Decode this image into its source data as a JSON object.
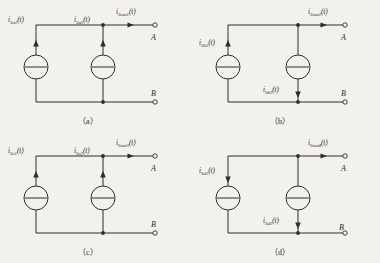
{
  "figure": {
    "type": "circuit-diagram",
    "background_color": "#f2f1ee",
    "line_color": "#2e2c2a"
  },
  "panels": [
    {
      "id": "a",
      "caption": "（a）",
      "terminal_a": "A",
      "terminal_b": "B",
      "output": {
        "label_main": "i",
        "label_sub": "Sout1",
        "label_tail": "(t)",
        "arrow_direction": "right"
      },
      "sources": [
        {
          "name": "source-left",
          "label_main": "i",
          "label_sub": "Sa1",
          "label_tail": "(t)",
          "arrow_direction": "up",
          "label_position": "top-left"
        },
        {
          "name": "source-right",
          "label_main": "i",
          "label_sub": "Sa2",
          "label_tail": "(t)",
          "arrow_direction": "up",
          "label_position": "top-left"
        }
      ]
    },
    {
      "id": "b",
      "caption": "（b）",
      "terminal_a": "A",
      "terminal_b": "B",
      "output": {
        "label_main": "i",
        "label_sub": "Sout2",
        "label_tail": "(t)",
        "arrow_direction": "right"
      },
      "sources": [
        {
          "name": "source-left",
          "label_main": "i",
          "label_sub": "Sb1",
          "label_tail": "(t)",
          "arrow_direction": "up",
          "label_position": "top-left"
        },
        {
          "name": "source-right",
          "label_main": "i",
          "label_sub": "Sb2",
          "label_tail": "(t)",
          "arrow_direction": "down",
          "label_position": "bottom-left"
        }
      ]
    },
    {
      "id": "c",
      "caption": "（c）",
      "terminal_a": "A",
      "terminal_b": "B",
      "output": {
        "label_main": "i",
        "label_sub": "Sout3",
        "label_tail": "(t)",
        "arrow_direction": "right"
      },
      "sources": [
        {
          "name": "source-left",
          "label_main": "i",
          "label_sub": "Sc1",
          "label_tail": "(t)",
          "arrow_direction": "up",
          "label_position": "top-left"
        },
        {
          "name": "source-right",
          "label_main": "i",
          "label_sub": "Sc2",
          "label_tail": "(t)",
          "arrow_direction": "up",
          "label_position": "top-left"
        }
      ]
    },
    {
      "id": "d",
      "caption": "（d）",
      "terminal_a": "A",
      "terminal_b": "B",
      "output": {
        "label_main": "i",
        "label_sub": "Sout4",
        "label_tail": "(t)",
        "arrow_direction": "right"
      },
      "sources": [
        {
          "name": "source-left",
          "label_main": "i",
          "label_sub": "Sd1",
          "label_tail": "(t)",
          "arrow_direction": "down",
          "label_position": "top-left"
        },
        {
          "name": "source-right",
          "label_main": "i",
          "label_sub": "Sd2",
          "label_tail": "(t)",
          "arrow_direction": "down",
          "label_position": "bottom-left"
        }
      ]
    }
  ]
}
